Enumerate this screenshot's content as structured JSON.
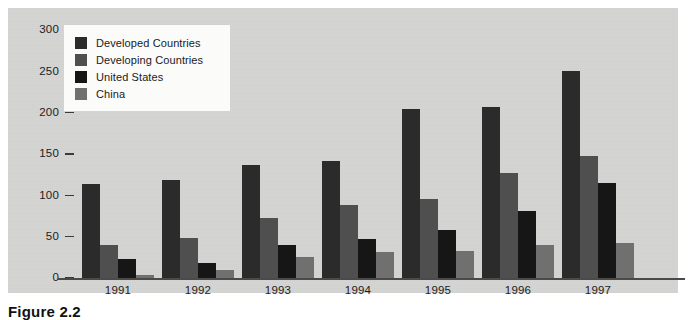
{
  "figure": {
    "caption": "Figure 2.2",
    "panel_background": "#d5d5d3",
    "page_background": "#ffffff"
  },
  "legend": {
    "position": "top-left-inside",
    "background": "#fbfbfa",
    "entries": [
      {
        "label": "Developed Countries",
        "color": "#2b2b2b"
      },
      {
        "label": "Developing Countries",
        "color": "#4f4f4f"
      },
      {
        "label": "United States",
        "color": "#161616"
      },
      {
        "label": "China",
        "color": "#707070"
      }
    ]
  },
  "chart_data": {
    "type": "bar",
    "title": "",
    "xlabel": "",
    "ylabel": "",
    "ylim": [
      0,
      300
    ],
    "yticks": [
      0,
      50,
      100,
      150,
      200,
      250,
      300
    ],
    "grid": false,
    "categories": [
      "1991",
      "1992",
      "1993",
      "1994",
      "1995",
      "1996",
      "1997"
    ],
    "series": [
      {
        "name": "Developed Countries",
        "color": "#2b2b2b",
        "values": [
          114,
          119,
          137,
          142,
          205,
          207,
          250
        ]
      },
      {
        "name": "Developing Countries",
        "color": "#4f4f4f",
        "values": [
          40,
          48,
          72,
          88,
          95,
          127,
          148
        ]
      },
      {
        "name": "United States",
        "color": "#161616",
        "values": [
          23,
          18,
          40,
          47,
          58,
          81,
          115
        ]
      },
      {
        "name": "China",
        "color": "#707070",
        "values": [
          4,
          10,
          26,
          31,
          33,
          40,
          42
        ]
      }
    ]
  }
}
